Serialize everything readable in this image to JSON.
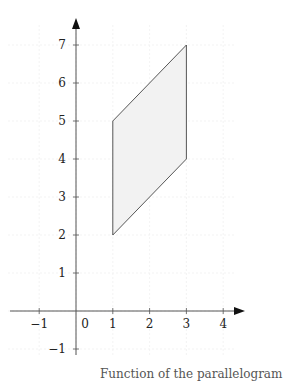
{
  "chart_data": {
    "type": "line",
    "title": "",
    "xlabel": "",
    "ylabel": "",
    "xlim": [
      -1.75,
      4.5
    ],
    "ylim": [
      -1.5,
      7.8
    ],
    "grid": true,
    "x_ticks": [
      -1,
      0,
      1,
      2,
      3,
      4
    ],
    "y_ticks": [
      -1,
      1,
      2,
      3,
      4,
      5,
      6,
      7
    ],
    "x_tick_labels": [
      "−1",
      "0",
      "1",
      "2",
      "3",
      "4"
    ],
    "y_tick_labels": [
      "−1",
      "1",
      "2",
      "3",
      "4",
      "5",
      "6",
      "7"
    ],
    "series": [
      {
        "name": "parallelogram",
        "shape": "polygon",
        "filled": true,
        "fill_color": "#f2f2f2",
        "stroke_color": "#444444",
        "points": [
          [
            1,
            2
          ],
          [
            3,
            4
          ],
          [
            3,
            7
          ],
          [
            1,
            5
          ]
        ]
      }
    ]
  },
  "caption": "Function of the parallelogram"
}
